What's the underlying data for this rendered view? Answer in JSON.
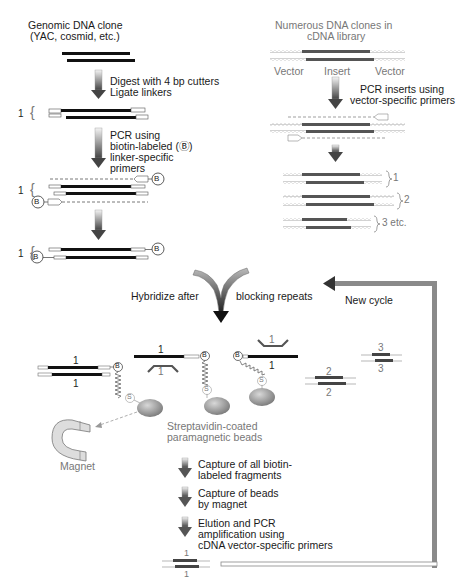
{
  "left_column": {
    "title_line1": "Genomic DNA clone",
    "title_line2": "(YAC, cosmid, etc.)",
    "step1_line1": "Digest with 4 bp cutters",
    "step1_line2": "Ligate linkers",
    "step2_line1": "PCR using",
    "step2_line2": "biotin-labeled (Ⓑ)",
    "step2_line3": "linker-specific",
    "step2_line4": "primers",
    "fragment_label": "1",
    "biotin_symbol": "B"
  },
  "right_column": {
    "title_line1": "Numerous DNA clones in",
    "title_line2": "cDNA library",
    "vector_left": "Vector",
    "insert": "Insert",
    "vector_right": "Vector",
    "step1_line1": "PCR inserts using",
    "step1_line2": "vector-specific primers",
    "products": [
      "1",
      "2",
      "3 etc."
    ]
  },
  "hybridize": {
    "left_text": "Hybridize after",
    "right_text": "blocking repeats",
    "new_cycle": "New cycle"
  },
  "hybrids": {
    "labels": [
      "1",
      "1",
      "1",
      "1",
      "1",
      "1",
      "2",
      "2",
      "3",
      "3"
    ],
    "streptavidin_symbol": "S",
    "biotin_symbol": "B"
  },
  "beads": {
    "line1": "Streptavidin-coated",
    "line2": "paramagnetic beads"
  },
  "magnet_label": "Magnet",
  "steps": [
    {
      "line1": "Capture of all biotin-",
      "line2": "labeled fragments"
    },
    {
      "line1": "Capture of beads",
      "line2": "by magnet"
    },
    {
      "line1": "Elution and PCR",
      "line2": "amplification using",
      "line3": "cDNA vector-specific primers"
    }
  ],
  "final_product": {
    "top": "1",
    "bottom": "1"
  },
  "colors": {
    "dna_black": "#111111",
    "cdna_insert": "#555555",
    "vector_gray": "#999999",
    "arrow_gray": "#777777",
    "bead": "#8a8a8a"
  }
}
